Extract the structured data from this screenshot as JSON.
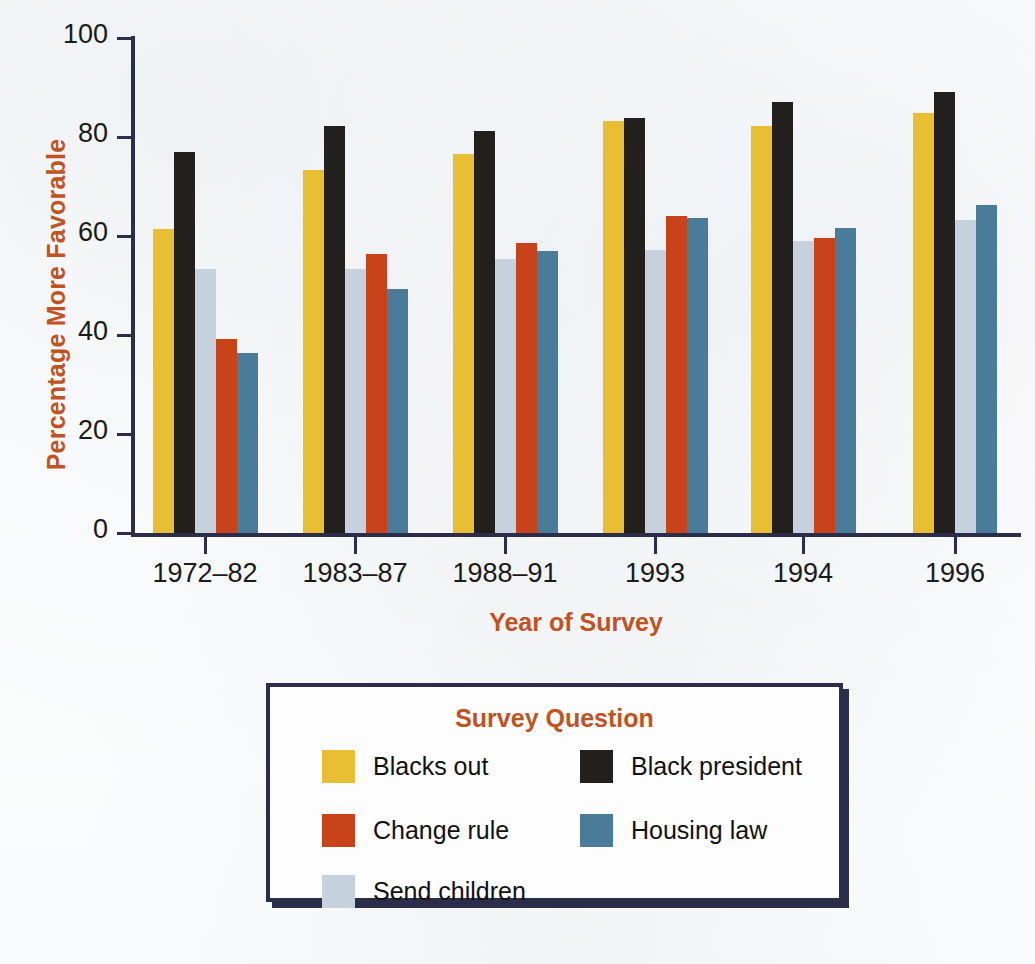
{
  "chart_data": {
    "type": "bar",
    "title": "",
    "xlabel": "Year of Survey",
    "ylabel": "Percentage More Favorable",
    "ylim": [
      0,
      100
    ],
    "yticks": [
      0,
      20,
      40,
      60,
      80,
      100
    ],
    "ytick_labels": [
      "0",
      "20",
      "40",
      "60",
      "80",
      "100"
    ],
    "grid": false,
    "legend_position": "below-plot",
    "legend_title": "Survey Question",
    "categories": [
      "1972–82",
      "1983–87",
      "1988–91",
      "1993",
      "1994",
      "1996"
    ],
    "series": [
      {
        "name": "Blacks out",
        "color": "#e8be33",
        "values": [
          61.4,
          73.4,
          76.5,
          83.2,
          82.2,
          84.9
        ]
      },
      {
        "name": "Black president",
        "color": "#231f1c",
        "values": [
          77.0,
          82.3,
          81.3,
          83.8,
          87.0,
          89.2
        ]
      },
      {
        "name": "Send children",
        "color": "#c5d1dc",
        "values": [
          53.4,
          53.3,
          55.4,
          57.2,
          58.9,
          63.3
        ]
      },
      {
        "name": "Change rule",
        "color": "#c8421a",
        "values": [
          39.2,
          56.3,
          58.6,
          64.1,
          59.7,
          null
        ]
      },
      {
        "name": "Housing law",
        "color": "#4a7c99",
        "values": [
          36.4,
          49.4,
          56.9,
          63.6,
          61.6,
          66.2
        ]
      }
    ]
  },
  "axes": {
    "y_title": "Percentage More Favorable",
    "x_title": "Year of Survey",
    "y_tick_labels": [
      "100",
      "80",
      "60",
      "40",
      "20",
      "0"
    ],
    "x_tick_labels": [
      "1972–82",
      "1983–87",
      "1988–91",
      "1993",
      "1994",
      "1996"
    ]
  },
  "legend": {
    "title": "Survey Question",
    "items": [
      {
        "label": "Blacks out",
        "color": "#e8be33",
        "swatch_name": "legend-swatch-blacks-out"
      },
      {
        "label": "Change rule",
        "color": "#c8421a",
        "swatch_name": "legend-swatch-change-rule"
      },
      {
        "label": "Send children",
        "color": "#c5d1dc",
        "swatch_name": "legend-swatch-send-children"
      },
      {
        "label": "Black president",
        "color": "#231f1c",
        "swatch_name": "legend-swatch-black-president"
      },
      {
        "label": "Housing law",
        "color": "#4a7c99",
        "swatch_name": "legend-swatch-housing-law"
      }
    ]
  },
  "colors": {
    "axis": "#2b2d4a",
    "title_accent": "#c0531f",
    "tick_text": "#1a1a1a",
    "background": "#ffffff"
  }
}
